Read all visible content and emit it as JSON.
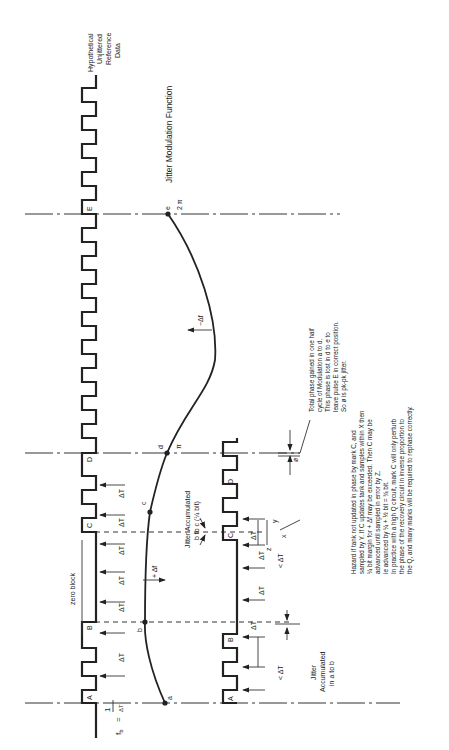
{
  "diagram": {
    "title": "Jitter Modulation Function",
    "reference_label": [
      "Hypothetical",
      "Unjittered",
      "Reference",
      "Data"
    ],
    "bit_frequency": {
      "lhs": "f",
      "sub": "b",
      "eq": "=",
      "num": "1",
      "den": "ΔT"
    },
    "marks": [
      "A",
      "B",
      "C",
      "D",
      "E"
    ],
    "curve_points": [
      "a",
      "b",
      "c",
      "d",
      "e"
    ],
    "phase_labels": {
      "d": "π",
      "e": "2 π"
    },
    "freq_labels": {
      "plus": "+ Δf",
      "minus": "−Δf"
    },
    "zero_block": "zero block",
    "delta_t": "ΔT",
    "less_delta_t": "< ΔT",
    "sample_labels": {
      "x": "x",
      "y": "y",
      "z": "z"
    },
    "phi": "ø",
    "jitter_a_to_b": [
      "Jitter",
      "Accumulated",
      "in a to b"
    ],
    "jitter_b_to_c": [
      "Jitter Accumulated",
      "b to c (¼ bit)"
    ],
    "total_phase_note": [
      "Total phase gained in one half",
      "cycle of Modulation a to d.",
      "This phase is lost in d to e to",
      "leave pulse E in correct position.",
      "So ø is pk-pk jitter."
    ],
    "hazard_note": [
      "Hazard if tank not updated in phase by mark C, and",
      "sampled by Y. If C updates tank and samples within X then",
      "¼ bit margin for + Δf may be exceeded. Then C may be",
      "advanced   until   sampled   in   error   by   Z.",
      "ie  advanced  by  ¼  +  ½  bit  =  ¾  bit.",
      "In practice with a high Q circuit, mark C will only perturb",
      "the phase of the recovery circuit in inverse proportion to",
      "the Q, and many marks will be required to rephase correctly."
    ]
  }
}
